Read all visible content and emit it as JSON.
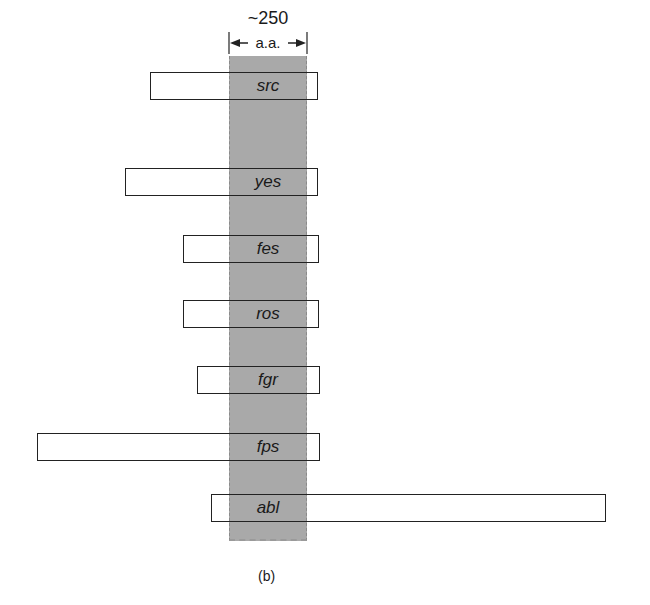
{
  "figure": {
    "caption": "(b)",
    "dimension": {
      "value": "~250",
      "label": "a.a."
    },
    "core_region": {
      "description": "shaded aligned core region",
      "color": "#a9a9a9"
    },
    "segments": [
      {
        "name": "src",
        "left": 150,
        "right": 318,
        "top": 72
      },
      {
        "name": "yes",
        "left": 125,
        "right": 318,
        "top": 168
      },
      {
        "name": "fes",
        "left": 183,
        "right": 319,
        "top": 235
      },
      {
        "name": "ros",
        "left": 183,
        "right": 319,
        "top": 300
      },
      {
        "name": "fgr",
        "left": 197,
        "right": 320,
        "top": 366
      },
      {
        "name": "fps",
        "left": 37,
        "right": 320,
        "top": 433
      },
      {
        "name": "abl",
        "left": 211,
        "right": 606,
        "top": 494
      }
    ]
  }
}
